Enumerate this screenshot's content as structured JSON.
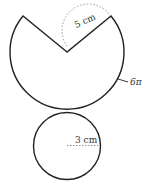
{
  "figure": {
    "type": "net-of-cone",
    "sector": {
      "slant_label": "5 cm",
      "arc_label": "6π"
    },
    "base_circle": {
      "radius_label": "3 cm"
    },
    "colors": {
      "stroke": "#222222",
      "dashed": "#888888",
      "text": "#333333"
    }
  }
}
